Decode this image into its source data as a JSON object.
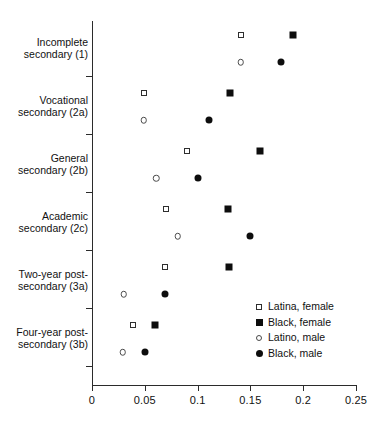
{
  "chart_data": {
    "type": "scatter",
    "title": "",
    "subtitle": "",
    "xlabel": "",
    "ylabel": "",
    "xlim": [
      0,
      0.25
    ],
    "xticks": [
      0,
      0.05,
      0.1,
      0.15,
      0.2,
      0.25
    ],
    "xtick_labels": [
      "0",
      "0.05",
      "0.1",
      "0.15",
      "0.2",
      "0.25"
    ],
    "grid": false,
    "legend_position": "bottom-right",
    "orientation": "horizontal",
    "categories": [
      "Incomplete secondary (1)",
      "Vocational secondary (2a)",
      "General secondary (2b)",
      "Academic secondary (2c)",
      "Two-year post-secondary (3a)",
      "Four-year post-secondary (3b)"
    ],
    "category_lines": [
      [
        "Incomplete",
        "secondary (1)"
      ],
      [
        "Vocational",
        "secondary (2a)"
      ],
      [
        "General",
        "secondary (2b)"
      ],
      [
        "Academic",
        "secondary (2c)"
      ],
      [
        "Two-year post-",
        "secondary (3a)"
      ],
      [
        "Four-year post-",
        "secondary (3b)"
      ]
    ],
    "series": [
      {
        "name": "Latina, female",
        "marker": "square-open",
        "color": "#2e2e2e",
        "values": [
          0.141,
          0.049,
          0.09,
          0.07,
          0.069,
          0.039
        ]
      },
      {
        "name": "Black, female",
        "marker": "square-filled",
        "color": "#0d0d0d",
        "values": [
          0.19,
          0.131,
          0.159,
          0.129,
          0.13,
          0.06
        ]
      },
      {
        "name": "Latino, male",
        "marker": "circle-open",
        "color": "#4a4a4a",
        "values": [
          0.141,
          0.049,
          0.061,
          0.081,
          0.03,
          0.029
        ]
      },
      {
        "name": "Black, male",
        "marker": "circle-filled",
        "color": "#0d0d0d",
        "values": [
          0.179,
          0.111,
          0.1,
          0.15,
          0.069,
          0.05
        ]
      }
    ],
    "legend": [
      {
        "label": "Latina, female",
        "marker": "square-open"
      },
      {
        "label": "Black, female",
        "marker": "square-filled"
      },
      {
        "label": "Latino, male",
        "marker": "circle-open"
      },
      {
        "label": "Black, male",
        "marker": "circle-filled"
      }
    ]
  },
  "layout": {
    "plot_left": 92,
    "plot_right": 356,
    "plot_top": 21,
    "plot_bottom": 385,
    "row_start_y": 35,
    "row_step": 58,
    "gender_offset": 27
  }
}
